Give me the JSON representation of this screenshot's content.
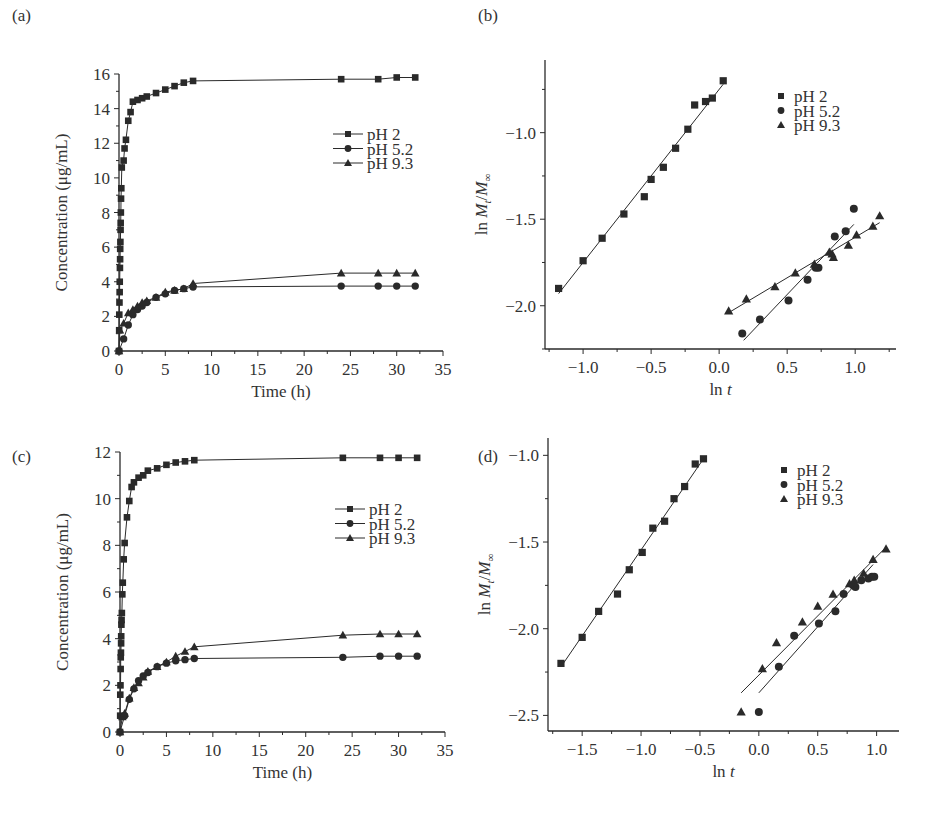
{
  "figure": {
    "width": 941,
    "height": 834,
    "colors": {
      "ink": "#2a2a2a",
      "background": "#ffffff"
    }
  },
  "chart_data": [
    {
      "id": "a",
      "panel_label": "(a)",
      "type": "line",
      "title": "",
      "xlabel": "Time (h)",
      "ylabel": "Concentration (μg/mL)",
      "xlim": [
        0,
        35
      ],
      "ylim": [
        0,
        16
      ],
      "xticks": [
        0,
        5,
        10,
        15,
        20,
        25,
        30,
        35
      ],
      "yticks": [
        0,
        2,
        4,
        6,
        8,
        10,
        12,
        14,
        16
      ],
      "grid": false,
      "legend_position": "upper right (inside)",
      "legend_style": "line-with-marker",
      "box": {
        "left": 119,
        "top": 74,
        "right": 443,
        "bottom": 351
      },
      "series": [
        {
          "name": "pH 2",
          "marker": "square",
          "x": [
            0,
            0.02,
            0.03,
            0.05,
            0.07,
            0.08,
            0.1,
            0.12,
            0.13,
            0.15,
            0.17,
            0.18,
            0.2,
            0.22,
            0.25,
            0.3,
            0.5,
            0.6,
            0.75,
            1,
            1.25,
            1.5,
            2,
            2.5,
            3,
            4,
            5,
            6,
            7,
            8,
            24,
            28,
            30,
            32
          ],
          "y": [
            0,
            1.2,
            2.1,
            2.8,
            3.4,
            4.0,
            4.8,
            5.3,
            5.9,
            6.3,
            7.0,
            7.4,
            8.0,
            8.8,
            9.4,
            10.6,
            11.0,
            11.7,
            12.2,
            13.3,
            13.8,
            14.4,
            14.5,
            14.6,
            14.7,
            14.9,
            15.1,
            15.3,
            15.5,
            15.6,
            15.7,
            15.7,
            15.8,
            15.8
          ],
          "note": "x values below 0.5 h are approximate (points stacked near t≈0)"
        },
        {
          "name": "pH 5.2",
          "marker": "circle",
          "x": [
            0,
            0.5,
            1,
            1.5,
            2,
            2.5,
            3,
            4,
            5,
            6,
            7,
            8,
            24,
            28,
            30,
            32
          ],
          "y": [
            0,
            0.7,
            1.5,
            2.1,
            2.4,
            2.6,
            2.8,
            3.1,
            3.3,
            3.5,
            3.6,
            3.7,
            3.75,
            3.75,
            3.75,
            3.75
          ]
        },
        {
          "name": "pH 9.3",
          "marker": "triangle",
          "x": [
            0,
            0.1,
            0.5,
            1,
            1.5,
            2,
            2.5,
            3,
            4,
            5,
            6,
            7,
            8,
            24,
            28,
            30,
            32
          ],
          "y": [
            0,
            1.2,
            1.6,
            2.2,
            2.4,
            2.6,
            2.8,
            2.9,
            3.1,
            3.4,
            3.5,
            3.6,
            3.9,
            4.5,
            4.5,
            4.5,
            4.5
          ]
        }
      ]
    },
    {
      "id": "b",
      "panel_label": "(b)",
      "type": "scatter",
      "title": "",
      "xlabel": "ln t",
      "ylabel": "ln M_t/M_∞",
      "xlim": [
        -1.28,
        1.3
      ],
      "ylim": [
        -2.25,
        -0.58
      ],
      "xticks": [
        -1.0,
        -0.5,
        0.0,
        0.5,
        1.0
      ],
      "yticks": [
        -2.0,
        -1.5,
        -1.0
      ],
      "grid": false,
      "legend_position": "upper right (inside)",
      "legend_style": "marker-only",
      "fit_lines": true,
      "box": {
        "left": 545,
        "top": 60,
        "right": 896,
        "bottom": 349
      },
      "series": [
        {
          "name": "pH 2",
          "marker": "square",
          "x": [
            -1.18,
            -1.0,
            -0.86,
            -0.7,
            -0.55,
            -0.5,
            -0.41,
            -0.32,
            -0.23,
            -0.18,
            -0.1,
            -0.05,
            0.03
          ],
          "y": [
            -1.9,
            -1.74,
            -1.61,
            -1.47,
            -1.37,
            -1.27,
            -1.2,
            -1.09,
            -0.98,
            -0.84,
            -0.82,
            -0.8,
            -0.7
          ],
          "fit": {
            "x": [
              -1.18,
              0.03
            ],
            "y": [
              -1.93,
              -0.72
            ]
          }
        },
        {
          "name": "pH 5.2",
          "marker": "circle",
          "x": [
            0.17,
            0.3,
            0.51,
            0.65,
            0.71,
            0.73,
            0.85,
            0.93,
            0.99
          ],
          "y": [
            -2.16,
            -2.08,
            -1.97,
            -1.85,
            -1.78,
            -1.78,
            -1.6,
            -1.57,
            -1.44
          ],
          "fit": {
            "x": [
              0.18,
              0.99
            ],
            "y": [
              -2.2,
              -1.53
            ]
          }
        },
        {
          "name": "pH 9.3",
          "marker": "triangle",
          "x": [
            0.07,
            0.2,
            0.41,
            0.56,
            0.7,
            0.81,
            0.83,
            0.84,
            0.95,
            1.01,
            1.13,
            1.18
          ],
          "y": [
            -2.03,
            -1.96,
            -1.89,
            -1.81,
            -1.76,
            -1.69,
            -1.7,
            -1.72,
            -1.65,
            -1.59,
            -1.54,
            -1.48
          ],
          "fit": {
            "x": [
              0.07,
              1.18
            ],
            "y": [
              -2.04,
              -1.52
            ]
          }
        }
      ]
    },
    {
      "id": "c",
      "panel_label": "(c)",
      "type": "line",
      "title": "",
      "xlabel": "Time (h)",
      "ylabel": "Concentration (μg/mL)",
      "xlim": [
        0,
        35
      ],
      "ylim": [
        0,
        12
      ],
      "xticks": [
        0,
        5,
        10,
        15,
        20,
        25,
        30,
        35
      ],
      "yticks": [
        0,
        2,
        4,
        6,
        8,
        10,
        12
      ],
      "grid": false,
      "legend_position": "upper right (inside)",
      "legend_style": "line-with-marker",
      "box": {
        "left": 120,
        "top": 452,
        "right": 445,
        "bottom": 732
      },
      "series": [
        {
          "name": "pH 2",
          "marker": "square",
          "x": [
            0,
            0.02,
            0.03,
            0.05,
            0.07,
            0.08,
            0.1,
            0.12,
            0.13,
            0.15,
            0.17,
            0.2,
            0.25,
            0.3,
            0.4,
            0.5,
            0.75,
            1,
            1.25,
            1.5,
            2,
            2.5,
            3,
            4,
            5,
            6,
            7,
            8,
            24,
            28,
            30,
            32
          ],
          "y": [
            0,
            0.7,
            1.6,
            2.0,
            2.7,
            3.2,
            3.4,
            3.8,
            4.1,
            4.6,
            4.8,
            5.1,
            5.9,
            6.4,
            7.4,
            8.1,
            9.2,
            9.9,
            10.5,
            10.7,
            10.9,
            11.0,
            11.2,
            11.3,
            11.45,
            11.55,
            11.6,
            11.65,
            11.75,
            11.75,
            11.75,
            11.75
          ],
          "note": "x values below 0.5 h are approximate (points stacked near t≈0)"
        },
        {
          "name": "pH 5.2",
          "marker": "circle",
          "x": [
            0,
            0.5,
            1,
            1.5,
            2,
            2.5,
            3,
            4,
            5,
            6,
            7,
            8,
            24,
            28,
            30,
            32
          ],
          "y": [
            0,
            0.7,
            1.4,
            1.85,
            2.2,
            2.4,
            2.55,
            2.8,
            2.95,
            3.05,
            3.1,
            3.15,
            3.2,
            3.25,
            3.25,
            3.25
          ]
        },
        {
          "name": "pH 9.3",
          "marker": "triangle",
          "x": [
            0,
            0.25,
            0.5,
            1,
            1.5,
            2,
            2.5,
            3,
            4,
            5,
            6,
            7,
            8,
            24,
            28,
            30,
            32
          ],
          "y": [
            0,
            0.65,
            0.8,
            1.45,
            1.9,
            2.1,
            2.35,
            2.6,
            2.8,
            3.0,
            3.25,
            3.45,
            3.65,
            4.15,
            4.2,
            4.2,
            4.2
          ]
        }
      ]
    },
    {
      "id": "d",
      "panel_label": "(d)",
      "type": "scatter",
      "title": "",
      "xlabel": "ln t",
      "ylabel": "ln M_t/M_∞",
      "xlim": [
        -1.79,
        1.19
      ],
      "ylim": [
        -2.59,
        -0.9
      ],
      "xticks": [
        -1.5,
        -1.0,
        -0.5,
        0.0,
        0.5,
        1.0
      ],
      "yticks": [
        -2.5,
        -2.0,
        -1.5,
        -1.0
      ],
      "grid": false,
      "legend_position": "upper right (inside)",
      "legend_style": "marker-only",
      "fit_lines": true,
      "box": {
        "left": 548,
        "top": 438,
        "right": 899,
        "bottom": 731
      },
      "series": [
        {
          "name": "pH 2",
          "marker": "square",
          "x": [
            -1.68,
            -1.5,
            -1.36,
            -1.2,
            -1.1,
            -0.99,
            -0.9,
            -0.8,
            -0.72,
            -0.63,
            -0.54,
            -0.47
          ],
          "y": [
            -2.2,
            -2.05,
            -1.9,
            -1.8,
            -1.66,
            -1.56,
            -1.42,
            -1.38,
            -1.25,
            -1.18,
            -1.05,
            -1.02
          ],
          "fit": {
            "x": [
              -1.68,
              -0.47
            ],
            "y": [
              -2.22,
              -1.02
            ]
          }
        },
        {
          "name": "pH 5.2",
          "marker": "circle",
          "x": [
            0.0,
            0.17,
            0.3,
            0.51,
            0.65,
            0.72,
            0.8,
            0.82,
            0.87,
            0.93,
            0.96,
            0.98
          ],
          "y": [
            -2.48,
            -2.22,
            -2.04,
            -1.97,
            -1.9,
            -1.8,
            -1.75,
            -1.76,
            -1.72,
            -1.71,
            -1.7,
            -1.7
          ],
          "fit": {
            "x": [
              0.0,
              0.97
            ],
            "y": [
              -2.37,
              -1.63
            ]
          }
        },
        {
          "name": "pH 9.3",
          "marker": "triangle",
          "x": [
            -0.15,
            0.03,
            0.15,
            0.37,
            0.5,
            0.63,
            0.77,
            0.81,
            0.89,
            0.97,
            1.08
          ],
          "y": [
            -2.48,
            -2.23,
            -2.08,
            -1.96,
            -1.87,
            -1.8,
            -1.74,
            -1.72,
            -1.68,
            -1.6,
            -1.54
          ],
          "fit": {
            "x": [
              -0.15,
              1.08
            ],
            "y": [
              -2.37,
              -1.53
            ]
          }
        }
      ]
    }
  ]
}
